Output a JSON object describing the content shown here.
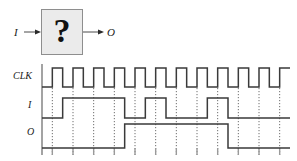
{
  "block_diagram": {
    "input_label": "I",
    "output_label": "O",
    "box_label": "?",
    "box_fill": "#ebebeb",
    "box_stroke": "#8e8e8e",
    "arrow_color": "#4a4a4a"
  },
  "timing": {
    "labels": {
      "clk": "CLK",
      "input": "I",
      "output": "O"
    },
    "axis_color": "#8c8c8c",
    "wave_color": "#3a3a3a",
    "grid_color": "#6e6e6e",
    "grid_style": "dotted"
  },
  "chart_data": {
    "type": "line",
    "title": "",
    "xlabel": "",
    "ylabel": "",
    "signals": [
      "CLK",
      "I",
      "O"
    ],
    "clock_cycles": 12,
    "clock_period": 21,
    "clock_duty": 0.5,
    "series": [
      {
        "name": "CLK",
        "values": [
          0,
          1,
          0,
          1,
          0,
          1,
          0,
          1,
          0,
          1,
          0,
          1,
          0,
          1,
          0,
          1,
          0,
          1,
          0,
          1,
          0,
          1,
          0,
          1,
          0
        ]
      },
      {
        "name": "I",
        "description": "input data stream sampled on clock edges",
        "values": [
          0,
          0,
          1,
          1,
          1,
          1,
          1,
          1,
          0,
          0,
          1,
          1,
          0,
          0,
          0,
          0,
          1,
          1,
          0,
          0,
          0,
          0,
          0,
          0
        ]
      },
      {
        "name": "O",
        "description": "output asserted after pattern detection",
        "values": [
          0,
          0,
          0,
          0,
          0,
          0,
          0,
          0,
          1,
          1,
          1,
          1,
          1,
          1,
          1,
          1,
          1,
          1,
          0,
          0,
          0,
          0,
          0,
          0
        ]
      }
    ],
    "grid": true,
    "legend": "none"
  }
}
